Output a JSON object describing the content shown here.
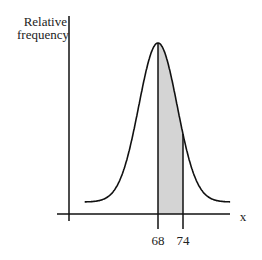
{
  "chart_data": {
    "type": "area",
    "title": "",
    "ylabel": "Relative frequency",
    "ylabel_lines": [
      "Relative",
      "frequency"
    ],
    "xlabel": "x",
    "distribution": {
      "kind": "normal",
      "mean": 68
    },
    "shaded_region": {
      "from": 68,
      "to": 74
    },
    "x_ticks": [
      {
        "value": 68,
        "label": "68"
      },
      {
        "value": 74,
        "label": "74"
      }
    ],
    "grid": false,
    "legend": "none",
    "colors": {
      "curve": "#111111",
      "shade": "#d4d4d4",
      "axis": "#111111"
    }
  }
}
